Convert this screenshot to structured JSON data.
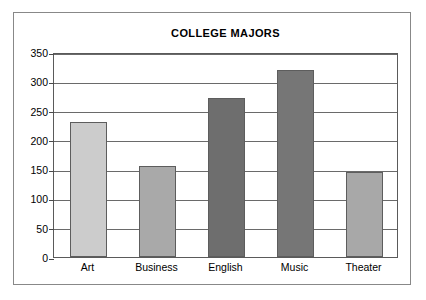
{
  "chart_data": {
    "type": "bar",
    "title": "COLLEGE MAJORS",
    "xlabel": "",
    "ylabel": "",
    "categories": [
      "Art",
      "Business",
      "English",
      "Music",
      "Theater"
    ],
    "values": [
      230,
      156,
      272,
      320,
      146
    ],
    "bar_colors": [
      "#cccccc",
      "#a9a9a9",
      "#6e6e6e",
      "#767676",
      "#a8a8a8"
    ],
    "ylim": [
      0,
      350
    ],
    "yticks": [
      0,
      50,
      100,
      150,
      200,
      250,
      300,
      350
    ],
    "ytick_labels": [
      "0",
      "50",
      "100",
      "150",
      "200",
      "250",
      "300",
      "350"
    ],
    "grid": true,
    "grid_axis": "y",
    "legend": false,
    "legend_position": "none",
    "series": [
      {
        "name": "Students",
        "values": [
          230,
          156,
          272,
          320,
          146
        ]
      }
    ]
  },
  "figure": {
    "background_color": "#ffffff",
    "frame_color": "#888888",
    "axis_color": "#5a5a5a",
    "gridline_color": "#6a6a6a",
    "text_color": "#000000"
  }
}
